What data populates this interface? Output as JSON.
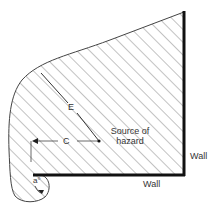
{
  "diagram": {
    "type": "hazard-zone-plan",
    "colors": {
      "outline": "#444444",
      "hatch": "#555555",
      "wall": "#111111",
      "background": "#ffffff",
      "text": "#333333"
    },
    "labels": {
      "E": "E",
      "C": "C",
      "angle": "a°",
      "source_line1": "Source of",
      "source_line2": "hazard",
      "wall_right": "Wall",
      "wall_bottom": "Wall"
    },
    "elements": {
      "source_point": {
        "x": 99,
        "y": 141
      },
      "wall_right": {
        "x": 184,
        "y1": 12,
        "y2": 175
      },
      "wall_bottom": {
        "y": 175,
        "x1": 34,
        "x2": 184
      }
    }
  }
}
